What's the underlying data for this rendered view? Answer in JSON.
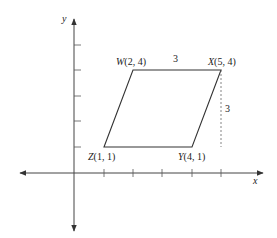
{
  "diagram": {
    "type": "coordinate-plane-parallelogram",
    "axes": {
      "x_label": "x",
      "y_label": "y"
    },
    "vertices": [
      {
        "name": "W",
        "coords": "(2, 4)",
        "label": "W(2, 4)",
        "x": 2,
        "y": 4
      },
      {
        "name": "X",
        "coords": "(5, 4)",
        "label": "X(5, 4)",
        "x": 5,
        "y": 4
      },
      {
        "name": "Y",
        "coords": "(4, 1)",
        "label": "Y(4, 1)",
        "x": 4,
        "y": 1
      },
      {
        "name": "Z",
        "coords": "(1, 1)",
        "label": "Z(1, 1)",
        "x": 1,
        "y": 1
      }
    ],
    "measurements": {
      "top_side_length": "3",
      "height": "3"
    },
    "x_ticks": [
      1,
      2,
      3,
      4,
      5
    ],
    "y_ticks": [
      1,
      2,
      3,
      4,
      5
    ]
  }
}
